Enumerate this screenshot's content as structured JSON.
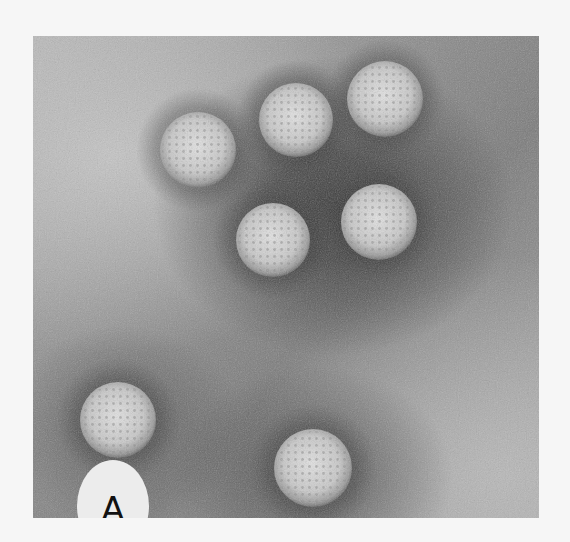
{
  "figure": {
    "panel_label": "A",
    "particle_count": 7,
    "colors": {
      "background": "#f6f6f6",
      "stain_dark": "#3c3c3c",
      "stain_light": "#b5b5b5",
      "particle": "#cfcfcf",
      "label_badge": "#ececec",
      "label_text": "#111111"
    },
    "particles": [
      {
        "cx": 165,
        "cy": 114,
        "r": 38
      },
      {
        "cx": 263,
        "cy": 84,
        "r": 37
      },
      {
        "cx": 352,
        "cy": 63,
        "r": 38
      },
      {
        "cx": 240,
        "cy": 204,
        "r": 37
      },
      {
        "cx": 346,
        "cy": 186,
        "r": 38
      },
      {
        "cx": 85,
        "cy": 384,
        "r": 38
      },
      {
        "cx": 280,
        "cy": 432,
        "r": 39
      }
    ]
  }
}
